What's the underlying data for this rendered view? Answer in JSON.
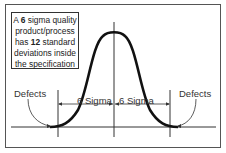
{
  "diagram": {
    "callout": {
      "line1_pre": "A ",
      "line1_bold": "6",
      "line1_post": " sigma quality",
      "line2": "product/process",
      "line3_pre": "has ",
      "line3_bold": "12",
      "line3_post": " standard",
      "line4": "deviations inside",
      "line5": "the specification"
    },
    "labels": {
      "defects_left": "Defects",
      "defects_right": "Defects",
      "sigma_left": "6 Sigma",
      "sigma_right": "6 Sigma"
    },
    "colors": {
      "frame": "#555555",
      "curve": "#111111",
      "lines": "#333333",
      "text": "#333333"
    }
  }
}
